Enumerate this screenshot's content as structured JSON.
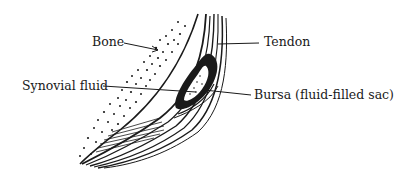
{
  "diagram": {
    "labels": {
      "bone": "Bone",
      "tendon": "Tendon",
      "synovial_fluid": "Synovial fluid",
      "bursa": "Bursa (fluid-filled sac)"
    },
    "colors": {
      "ink": "#1a1a1a",
      "background": "#ffffff"
    }
  }
}
